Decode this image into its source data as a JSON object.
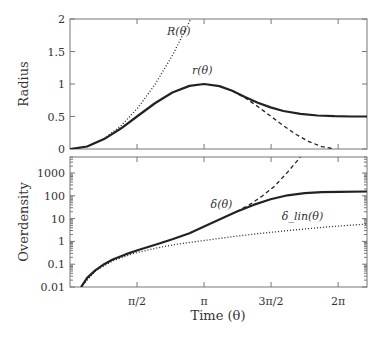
{
  "chart_data": [
    {
      "type": "line",
      "panel": "top",
      "ylabel": "Radius",
      "xlim": [
        0,
        6.96
      ],
      "ylim": [
        0,
        2
      ],
      "yticks": [
        0,
        0.5,
        1,
        1.5,
        2
      ],
      "ytick_labels": [
        "0",
        "0.5",
        "1",
        "1.5",
        "2"
      ],
      "xticks": [
        1.5708,
        3.1416,
        4.7124,
        6.2832
      ],
      "series": [
        {
          "name": "R(θ)",
          "style": "dotted",
          "label_pos": [
            2.55,
            1.75
          ],
          "x": [
            0,
            0.4,
            0.8,
            1.2,
            1.6,
            2.0,
            2.4,
            2.8,
            2.83
          ],
          "y": [
            0,
            0.04,
            0.16,
            0.36,
            0.64,
            1.0,
            1.44,
            1.96,
            2.0
          ]
        },
        {
          "name": "r(θ)",
          "style": "solid",
          "label_pos": [
            3.1,
            1.15
          ],
          "x": [
            0,
            0.4,
            0.8,
            1.2,
            1.6,
            2.0,
            2.4,
            2.8,
            3.1416,
            3.5,
            3.8,
            4.1,
            4.4,
            4.7,
            5.0,
            5.4,
            5.8,
            6.2,
            6.6,
            6.96
          ],
          "y": [
            0,
            0.039,
            0.152,
            0.319,
            0.515,
            0.708,
            0.869,
            0.971,
            1.0,
            0.968,
            0.895,
            0.8,
            0.71,
            0.64,
            0.585,
            0.54,
            0.515,
            0.505,
            0.5,
            0.5
          ]
        },
        {
          "name": "r(θ) collapse",
          "style": "dashed",
          "x": [
            3.8,
            4.1,
            4.4,
            4.7,
            5.0,
            5.3,
            5.6,
            5.9,
            6.2
          ],
          "y": [
            0.895,
            0.788,
            0.654,
            0.506,
            0.358,
            0.223,
            0.113,
            0.037,
            0.0
          ]
        }
      ]
    },
    {
      "type": "line",
      "panel": "bottom",
      "ylabel": "Overdensity",
      "xlabel": "Time (θ)",
      "xlim": [
        0,
        6.96
      ],
      "ylim": [
        0.01,
        5000
      ],
      "yscale": "log",
      "yticks": [
        0.01,
        0.1,
        1,
        10,
        100,
        1000
      ],
      "ytick_labels": [
        "0.01",
        "0.1",
        "1",
        "10",
        "100",
        "1000"
      ],
      "xticks": [
        1.5708,
        3.1416,
        4.7124,
        6.2832
      ],
      "xtick_labels": [
        "π/2",
        "π",
        "3π/2",
        "2π"
      ],
      "series": [
        {
          "name": "δ(θ)",
          "style": "solid",
          "label_pos": [
            3.55,
            30
          ],
          "x": [
            0.26,
            0.4,
            0.6,
            0.8,
            1.0,
            1.3,
            1.6,
            2.0,
            2.4,
            2.8,
            3.1416,
            3.5,
            3.9,
            4.3,
            4.7,
            5.1,
            5.5,
            5.9,
            6.3,
            6.96
          ],
          "y": [
            0.01,
            0.025,
            0.055,
            0.1,
            0.16,
            0.27,
            0.42,
            0.72,
            1.25,
            2.3,
            4.5,
            9,
            20,
            40,
            70,
            105,
            130,
            145,
            150,
            155
          ]
        },
        {
          "name": "δ(θ) collapse",
          "style": "dashed",
          "x": [
            3.9,
            4.2,
            4.5,
            4.8,
            5.1,
            5.4
          ],
          "y": [
            20,
            40,
            95,
            270,
            1100,
            5000
          ]
        },
        {
          "name": "δ_lin(θ)",
          "style": "dotted",
          "label_pos": [
            5.45,
            9
          ],
          "x": [
            0.26,
            0.6,
            1.0,
            1.5,
            2.0,
            2.5,
            3.1416,
            3.8,
            4.5,
            5.2,
            6.0,
            6.96
          ],
          "y": [
            0.01,
            0.052,
            0.14,
            0.3,
            0.5,
            0.75,
            1.1,
            1.6,
            2.3,
            3.1,
            4.3,
            5.8
          ]
        }
      ]
    }
  ],
  "labels": {
    "top_ylabel": "Radius",
    "bottom_ylabel": "Overdensity",
    "xlabel": "Time (θ)",
    "R_label": "R(θ)",
    "r_label": "r(θ)",
    "delta_label": "δ(θ)",
    "delta_lin_label": "δlin(θ)"
  }
}
